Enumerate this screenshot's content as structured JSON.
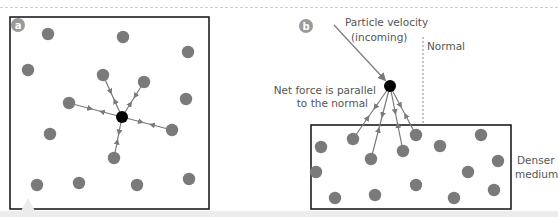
{
  "colors": {
    "particle": "#7a7a7a",
    "central_particle": "#000000",
    "arrow": "#7a7a7a",
    "box_border": "#111111",
    "label_text": "#555555",
    "badge": "#9a9a9a",
    "normal_line": "#888888",
    "bottom_bar": "#ececec"
  },
  "panel_a": {
    "badge": "a",
    "box": {
      "x": 10,
      "y": 17,
      "w": 199,
      "h": 192
    },
    "central_particle": {
      "x": 122,
      "y": 117,
      "r": 6
    },
    "attracting_particles": [
      {
        "x": 103,
        "y": 75
      },
      {
        "x": 144,
        "y": 82
      },
      {
        "x": 69,
        "y": 103
      },
      {
        "x": 172,
        "y": 130
      },
      {
        "x": 114,
        "y": 158
      }
    ],
    "other_particles": [
      {
        "x": 48,
        "y": 34
      },
      {
        "x": 123,
        "y": 37
      },
      {
        "x": 188,
        "y": 52
      },
      {
        "x": 28,
        "y": 70
      },
      {
        "x": 186,
        "y": 99
      },
      {
        "x": 50,
        "y": 134
      },
      {
        "x": 37,
        "y": 185
      },
      {
        "x": 79,
        "y": 183
      },
      {
        "x": 137,
        "y": 185
      },
      {
        "x": 189,
        "y": 179
      }
    ]
  },
  "panel_b": {
    "badge": "b",
    "box": {
      "x": 311,
      "y": 125,
      "w": 200,
      "h": 84
    },
    "central_particle": {
      "x": 390,
      "y": 86,
      "r": 6
    },
    "velocity_label_line1": "Particle velocity",
    "velocity_label_line2": "(incoming)",
    "normal_label": "Normal",
    "net_force_label_line1": "Net force is parallel",
    "net_force_label_line2": "to the normal",
    "medium_label_line1": "Denser",
    "medium_label_line2": "medium",
    "attracting_particles": [
      {
        "x": 353,
        "y": 139
      },
      {
        "x": 371,
        "y": 159
      },
      {
        "x": 403,
        "y": 151
      },
      {
        "x": 416,
        "y": 135
      }
    ],
    "other_particles": [
      {
        "x": 321,
        "y": 147
      },
      {
        "x": 316,
        "y": 172
      },
      {
        "x": 335,
        "y": 198
      },
      {
        "x": 375,
        "y": 195
      },
      {
        "x": 416,
        "y": 185
      },
      {
        "x": 440,
        "y": 146
      },
      {
        "x": 468,
        "y": 172
      },
      {
        "x": 481,
        "y": 135
      },
      {
        "x": 498,
        "y": 161
      },
      {
        "x": 454,
        "y": 198
      },
      {
        "x": 494,
        "y": 190
      }
    ]
  }
}
